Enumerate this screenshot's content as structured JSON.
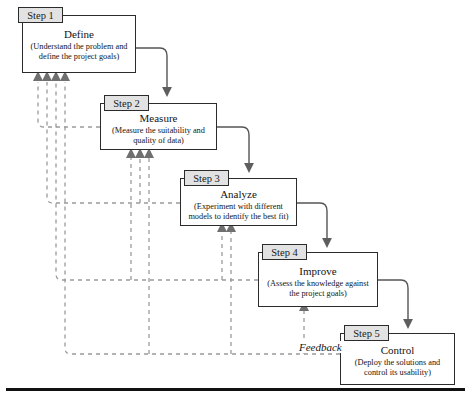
{
  "diagram": {
    "feedback_label": "Feedback",
    "colors": {
      "tab_fill": "#e2e2e2",
      "stroke": "#2b2b2b",
      "dashed": "#9a9a9a",
      "arrow": "#6f6f6f",
      "text": "#141414",
      "base_rule": "#111111"
    },
    "steps": [
      {
        "tab": "Step 1",
        "title": "Define",
        "desc": "(Understand the problem and define the project goals)",
        "feedback_arrows": 4
      },
      {
        "tab": "Step 2",
        "title": "Measure",
        "desc": "(Measure the suitability and quality of data)",
        "feedback_arrows": 3
      },
      {
        "tab": "Step 3",
        "title": "Analyze",
        "desc": "(Experiment with different models to identify the best fit)",
        "feedback_arrows": 2
      },
      {
        "tab": "Step 4",
        "title": "Improve",
        "desc": "(Assess the knowledge against the project goals)",
        "feedback_arrows": 1
      },
      {
        "tab": "Step 5",
        "title": "Control",
        "desc": "(Deploy the solutions and control its usability)",
        "feedback_arrows": 0
      }
    ]
  }
}
